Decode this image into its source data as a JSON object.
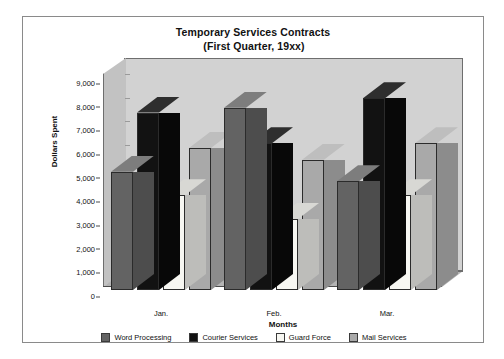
{
  "chart_data": {
    "type": "bar",
    "title": "Temporary Services Contracts",
    "subtitle": "(First Quarter, 19xx)",
    "xlabel": "Months",
    "ylabel": "Dollars Spent",
    "categories": [
      "Jan.",
      "Feb.",
      "Mar."
    ],
    "ylim": [
      0,
      9000
    ],
    "ytick_labels": [
      "9,000",
      "8,000",
      "7,000",
      "6,000",
      "5,000",
      "4,000",
      "3,000",
      "2,000",
      "1,000",
      "0"
    ],
    "ytick_values": [
      9000,
      8000,
      7000,
      6000,
      5000,
      4000,
      3000,
      2000,
      1000,
      0
    ],
    "grid": false,
    "legend_position": "bottom",
    "style": "3d-column",
    "series": [
      {
        "name": "Word Processing",
        "color": "#636363",
        "values": [
          5000,
          7700,
          4600
        ]
      },
      {
        "name": "Courier Services",
        "color": "#121212",
        "values": [
          7500,
          6200,
          8100
        ]
      },
      {
        "name": "Guard Force",
        "color": "#f7f7f2",
        "values": [
          4000,
          3000,
          4000
        ]
      },
      {
        "name": "Mail Services",
        "color": "#a9a9a9",
        "values": [
          6000,
          5500,
          6200
        ]
      }
    ]
  },
  "colors": {
    "plot_back_wall": "#d2d2d2",
    "plot_left_wall": "#c2c2c2",
    "plot_floor": "#b4b4b4",
    "frame_border": "#8a8a8a",
    "text": "#111111",
    "background": "#ffffff"
  }
}
